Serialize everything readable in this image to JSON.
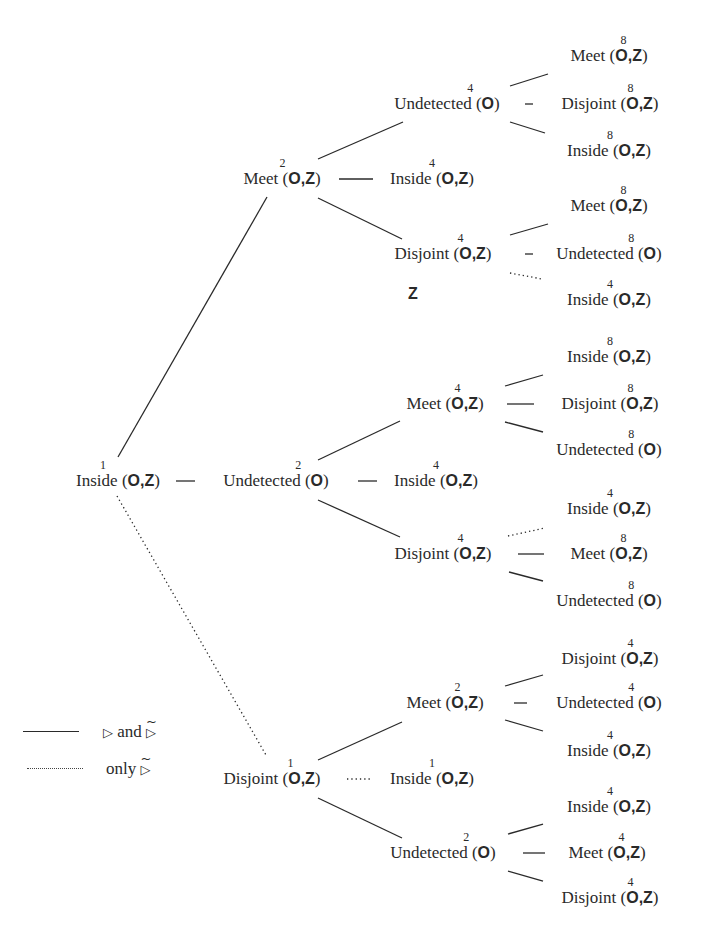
{
  "legend": {
    "solid": {
      "symbol": "▷",
      "text": "and",
      "symbol2": "▷",
      "symbol2_tilde": "~"
    },
    "dotted": {
      "text": "only",
      "symbol": "▷",
      "symbol_tilde": "~"
    }
  },
  "stray_label": "Z",
  "nodes": {
    "root": {
      "name": "Inside",
      "args": "O,Z",
      "level": "1"
    },
    "l1_meet": {
      "name": "Meet",
      "args": "O,Z",
      "level": "2"
    },
    "l1_undetected": {
      "name": "Undetected",
      "args": "O",
      "level": "2"
    },
    "l1_disjoint": {
      "name": "Disjoint",
      "args": "O,Z",
      "level": "1"
    },
    "l2_a_undetected": {
      "name": "Undetected",
      "args": "O",
      "level": "4"
    },
    "l2_a_inside": {
      "name": "Inside",
      "args": "O,Z",
      "level": "4"
    },
    "l2_a_disjoint": {
      "name": "Disjoint",
      "args": "O,Z",
      "level": "4"
    },
    "l2_b_meet": {
      "name": "Meet",
      "args": "O,Z",
      "level": "4"
    },
    "l2_b_inside": {
      "name": "Inside",
      "args": "O,Z",
      "level": "4"
    },
    "l2_b_disjoint": {
      "name": "Disjoint",
      "args": "O,Z",
      "level": "4"
    },
    "l2_c_meet": {
      "name": "Meet",
      "args": "O,Z",
      "level": "2"
    },
    "l2_c_inside": {
      "name": "Inside",
      "args": "O,Z",
      "level": "1"
    },
    "l2_c_undetected": {
      "name": "Undetected",
      "args": "O",
      "level": "2"
    },
    "l3_a1_meet": {
      "name": "Meet",
      "args": "O,Z",
      "level": "8"
    },
    "l3_a1_disjoint": {
      "name": "Disjoint",
      "args": "O,Z",
      "level": "8"
    },
    "l3_a1_inside": {
      "name": "Inside",
      "args": "O,Z",
      "level": "8"
    },
    "l3_a3_meet": {
      "name": "Meet",
      "args": "O,Z",
      "level": "8"
    },
    "l3_a3_undetected": {
      "name": "Undetected",
      "args": "O",
      "level": "8"
    },
    "l3_a3_inside": {
      "name": "Inside",
      "args": "O,Z",
      "level": "4"
    },
    "l3_b1_inside": {
      "name": "Inside",
      "args": "O,Z",
      "level": "8"
    },
    "l3_b1_disjoint": {
      "name": "Disjoint",
      "args": "O,Z",
      "level": "8"
    },
    "l3_b1_undetected": {
      "name": "Undetected",
      "args": "O",
      "level": "8"
    },
    "l3_b3_inside": {
      "name": "Inside",
      "args": "O,Z",
      "level": "4"
    },
    "l3_b3_meet": {
      "name": "Meet",
      "args": "O,Z",
      "level": "8"
    },
    "l3_b3_undetected": {
      "name": "Undetected",
      "args": "O",
      "level": "8"
    },
    "l3_c1_disjoint": {
      "name": "Disjoint",
      "args": "O,Z",
      "level": "4"
    },
    "l3_c1_undetected": {
      "name": "Undetected",
      "args": "O",
      "level": "4"
    },
    "l3_c1_inside": {
      "name": "Inside",
      "args": "O,Z",
      "level": "4"
    },
    "l3_c3_inside": {
      "name": "Inside",
      "args": "O,Z",
      "level": "4"
    },
    "l3_c3_meet": {
      "name": "Meet",
      "args": "O,Z",
      "level": "4"
    },
    "l3_c3_disjoint": {
      "name": "Disjoint",
      "args": "O,Z",
      "level": "4"
    }
  },
  "edges": [
    {
      "from": "root",
      "to": "l1_meet",
      "style": "solid"
    },
    {
      "from": "root",
      "to": "l1_undetected",
      "style": "solid"
    },
    {
      "from": "root",
      "to": "l1_disjoint",
      "style": "dotted"
    },
    {
      "from": "l1_meet",
      "to": "l2_a_undetected",
      "style": "solid"
    },
    {
      "from": "l1_meet",
      "to": "l2_a_inside",
      "style": "solid"
    },
    {
      "from": "l1_meet",
      "to": "l2_a_disjoint",
      "style": "solid"
    },
    {
      "from": "l1_undetected",
      "to": "l2_b_meet",
      "style": "solid"
    },
    {
      "from": "l1_undetected",
      "to": "l2_b_inside",
      "style": "solid"
    },
    {
      "from": "l1_undetected",
      "to": "l2_b_disjoint",
      "style": "solid"
    },
    {
      "from": "l1_disjoint",
      "to": "l2_c_meet",
      "style": "solid"
    },
    {
      "from": "l1_disjoint",
      "to": "l2_c_inside",
      "style": "dotted"
    },
    {
      "from": "l1_disjoint",
      "to": "l2_c_undetected",
      "style": "solid"
    },
    {
      "from": "l2_a_undetected",
      "to": "l3_a1_meet",
      "style": "solid"
    },
    {
      "from": "l2_a_undetected",
      "to": "l3_a1_disjoint",
      "style": "solid"
    },
    {
      "from": "l2_a_undetected",
      "to": "l3_a1_inside",
      "style": "solid"
    },
    {
      "from": "l2_a_disjoint",
      "to": "l3_a3_meet",
      "style": "solid"
    },
    {
      "from": "l2_a_disjoint",
      "to": "l3_a3_undetected",
      "style": "solid"
    },
    {
      "from": "l2_a_disjoint",
      "to": "l3_a3_inside",
      "style": "dotted"
    },
    {
      "from": "l2_b_meet",
      "to": "l3_b1_inside",
      "style": "solid"
    },
    {
      "from": "l2_b_meet",
      "to": "l3_b1_disjoint",
      "style": "solid"
    },
    {
      "from": "l2_b_meet",
      "to": "l3_b1_undetected",
      "style": "solid"
    },
    {
      "from": "l2_b_disjoint",
      "to": "l3_b3_inside",
      "style": "dotted"
    },
    {
      "from": "l2_b_disjoint",
      "to": "l3_b3_meet",
      "style": "solid"
    },
    {
      "from": "l2_b_disjoint",
      "to": "l3_b3_undetected",
      "style": "solid"
    },
    {
      "from": "l2_c_meet",
      "to": "l3_c1_disjoint",
      "style": "solid"
    },
    {
      "from": "l2_c_meet",
      "to": "l3_c1_undetected",
      "style": "solid"
    },
    {
      "from": "l2_c_meet",
      "to": "l3_c1_inside",
      "style": "solid"
    },
    {
      "from": "l2_c_undetected",
      "to": "l3_c3_inside",
      "style": "solid"
    },
    {
      "from": "l2_c_undetected",
      "to": "l3_c3_meet",
      "style": "solid"
    },
    {
      "from": "l2_c_undetected",
      "to": "l3_c3_disjoint",
      "style": "solid"
    }
  ],
  "colors": {
    "ink": "#2a2a2a",
    "background": "#ffffff"
  }
}
